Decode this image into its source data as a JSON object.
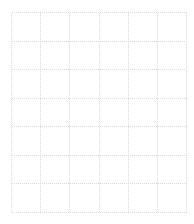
{
  "page": {
    "width": 194,
    "height": 224,
    "background_color": "#ffffff"
  },
  "header": {
    "clipped_text_fragments": [
      {
        "text": "—",
        "left": 17,
        "width": 9
      },
      {
        "text": "—",
        "left": 38,
        "width": 6
      },
      {
        "text": "—",
        "left": 50,
        "width": 7
      },
      {
        "text": "——",
        "left": 72,
        "width": 14
      }
    ],
    "color": "#b9b9bd"
  },
  "grid": {
    "left": 11,
    "top": 12,
    "right": 186,
    "bottom": 212,
    "columns": 6,
    "rows": 7,
    "cell_width": 29.17,
    "cell_height": 28.57,
    "line_color": "#d8d8dc",
    "line_width": 1,
    "dash_pattern": "1 1",
    "style": "dotted"
  }
}
